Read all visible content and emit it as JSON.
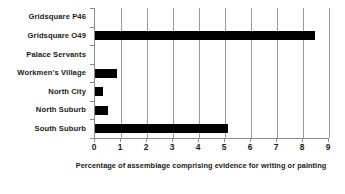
{
  "chart_data": {
    "type": "bar",
    "orientation": "horizontal",
    "title": "",
    "subtitle": "",
    "xlabel": "Percentage of assemblage comprising evidence for writing or painting",
    "ylabel": "",
    "categories": [
      "Gridsquare P46",
      "Gridsquare O49",
      "Palace Servants",
      "Workmen's Village",
      "North City",
      "North Suburb",
      "South Suburb"
    ],
    "values": [
      0,
      8.45,
      0,
      0.85,
      0.3,
      0.5,
      5.1
    ],
    "xlim": [
      0,
      9
    ],
    "xticks": [
      0,
      1,
      2,
      3,
      4,
      5,
      6,
      7,
      8,
      9
    ],
    "xtick_labels": [
      "0",
      "1",
      "2",
      "3",
      "4",
      "5",
      "6",
      "7",
      "8",
      "9"
    ],
    "grid": true,
    "grid_axis": "x",
    "legend": false,
    "legend_position": "none",
    "bar_color": "#000000",
    "background_color": "#ffffff",
    "gridline_color": "#9a9a9a",
    "axis_color": "#8c8c8c"
  }
}
